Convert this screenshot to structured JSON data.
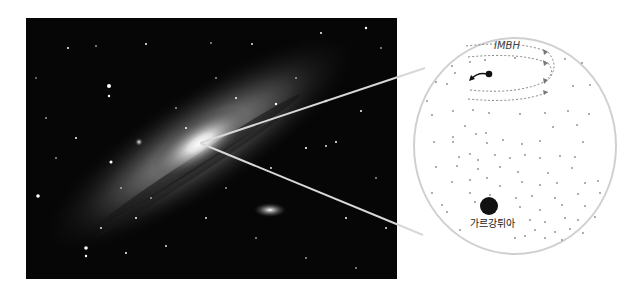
{
  "figure": {
    "left_panel": {
      "subject": "spiral galaxy photograph (Andromeda-like)"
    },
    "zoom_circle": {
      "labels": {
        "imbh": "IMBH",
        "gargantua": "가르강튀아"
      }
    }
  },
  "colors": {
    "zoom_line": "#d8d8d8",
    "circle_fill": "#ffffff",
    "circle_stroke": "#d0d0d0",
    "dots": "#777777",
    "black_hole": "#111111"
  }
}
